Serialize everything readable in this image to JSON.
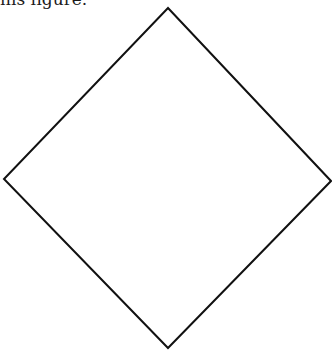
{
  "caption": {
    "text": "his figure."
  },
  "figure": {
    "shape": "diamond",
    "stroke_color": "#111111",
    "fill_color": "#ffffff",
    "vertices": {
      "top": [
        168,
        8
      ],
      "right": [
        331,
        181
      ],
      "bottom": [
        168,
        348
      ],
      "left": [
        4,
        179
      ]
    }
  }
}
